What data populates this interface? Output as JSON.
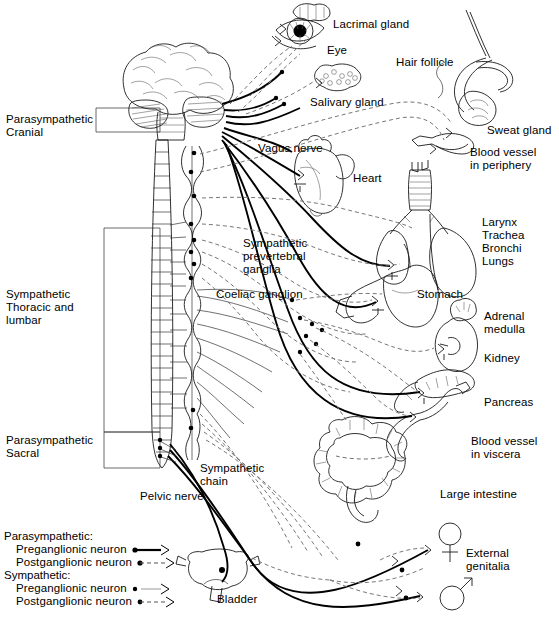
{
  "diagram": {
    "type": "anatomical-schematic",
    "width": 559,
    "height": 628
  },
  "divisions": [
    {
      "id": "para-cranial",
      "label": "Parasympathetic\nCranial",
      "x": 6,
      "y": 113
    },
    {
      "id": "symp-thoracolumbar",
      "label": "Sympathetic\nThoracic and\nlumbar",
      "x": 6,
      "y": 288
    },
    {
      "id": "para-sacral",
      "label": "Parasympathetic\nSacral",
      "x": 6,
      "y": 434
    }
  ],
  "organ_labels": [
    {
      "id": "lacrimal-gland",
      "label": "Lacrimal gland",
      "x": 333,
      "y": 18
    },
    {
      "id": "eye",
      "label": "Eye",
      "x": 327,
      "y": 44
    },
    {
      "id": "hair-follicle",
      "label": "Hair follicle",
      "x": 396,
      "y": 56
    },
    {
      "id": "salivary-gland",
      "label": "Salivary gland",
      "x": 310,
      "y": 96
    },
    {
      "id": "sweat-gland",
      "label": "Sweat gland",
      "x": 487,
      "y": 124
    },
    {
      "id": "blood-vessel-periphery",
      "label": "Blood vessel\nin periphery",
      "x": 470,
      "y": 146
    },
    {
      "id": "vagus-nerve",
      "label": "Vagus nerve",
      "x": 258,
      "y": 142
    },
    {
      "id": "heart",
      "label": "Heart",
      "x": 353,
      "y": 172
    },
    {
      "id": "larynx-trachea-bronchi-lungs",
      "label": "Larynx\nTrachea\nBronchi\nLungs",
      "x": 482,
      "y": 216
    },
    {
      "id": "sympathetic-prevertebral-ganglia",
      "label": "Sympathetic\nprevertebral\nganglia",
      "x": 243,
      "y": 237
    },
    {
      "id": "coeliac-ganglion",
      "label": "Coeliac ganglion",
      "x": 216,
      "y": 288
    },
    {
      "id": "stomach",
      "label": "Stomach",
      "x": 417,
      "y": 288
    },
    {
      "id": "adrenal-medulla",
      "label": "Adrenal\nmedulla",
      "x": 484,
      "y": 310
    },
    {
      "id": "kidney",
      "label": "Kidney",
      "x": 484,
      "y": 352
    },
    {
      "id": "pancreas",
      "label": "Pancreas",
      "x": 484,
      "y": 396
    },
    {
      "id": "blood-vessel-viscera",
      "label": "Blood vessel\nin viscera",
      "x": 471,
      "y": 435
    },
    {
      "id": "large-intestine",
      "label": "Large intestine",
      "x": 440,
      "y": 488
    },
    {
      "id": "sympathetic-chain",
      "label": "Sympathetic\nchain",
      "x": 200,
      "y": 462
    },
    {
      "id": "pelvic-nerve",
      "label": "Pelvic nerve",
      "x": 140,
      "y": 490
    },
    {
      "id": "bladder",
      "label": "Bladder",
      "x": 217,
      "y": 593
    },
    {
      "id": "external-genitalia",
      "label": "External\ngenitalia",
      "x": 466,
      "y": 547
    }
  ],
  "legend": {
    "groups": [
      {
        "id": "parasympathetic",
        "heading": "Parasympathetic:",
        "entries": [
          {
            "id": "para-preganglionic",
            "label": "Preganglionic neuron",
            "style": "solid-thick"
          },
          {
            "id": "para-postganglionic",
            "label": "Postganglionic neuron",
            "style": "dashed"
          }
        ]
      },
      {
        "id": "sympathetic",
        "heading": "Sympathetic:",
        "entries": [
          {
            "id": "symp-preganglionic",
            "label": "Preganglionic neuron",
            "style": "solid-thin"
          },
          {
            "id": "symp-postganglionic",
            "label": "Postganglionic neuron",
            "style": "dashed"
          }
        ]
      }
    ]
  },
  "colors": {
    "ink": "#1a1a1a",
    "dashed": "#777777",
    "background": "#ffffff"
  }
}
